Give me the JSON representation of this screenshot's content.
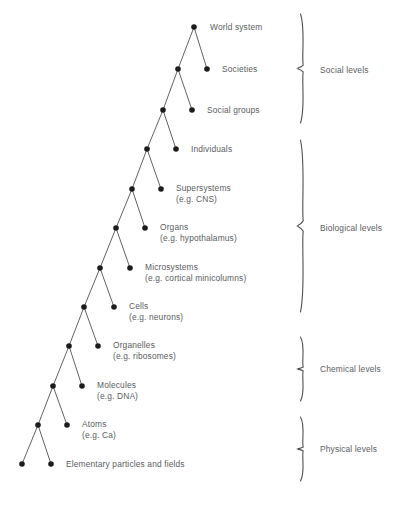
{
  "figure": {
    "type": "hierarchy-tree-diagram",
    "background_color": "#ffffff",
    "line_color": "#4d5053",
    "node_color": "#1c1c1c",
    "text_color": "#5a5d60"
  },
  "tree": {
    "description": "Binary branching hierarchy descending from World system at the apex to Elementary particles and fields at the base.",
    "nodes": [
      {
        "id": "world-system",
        "x": 194,
        "y": 27,
        "label": "World system",
        "sublabel": "",
        "label_x": 210,
        "label_y": 22,
        "labeled": true
      },
      {
        "id": "societies",
        "x": 207,
        "y": 69,
        "label": "Societies",
        "sublabel": "",
        "label_x": 222,
        "label_y": 64,
        "labeled": true
      },
      {
        "id": "societies-parent",
        "x": 178,
        "y": 69,
        "label": "",
        "sublabel": "",
        "label_x": 0,
        "label_y": 0,
        "labeled": false
      },
      {
        "id": "social-groups",
        "x": 192,
        "y": 110,
        "label": "Social groups",
        "sublabel": "",
        "label_x": 207,
        "label_y": 105,
        "labeled": true
      },
      {
        "id": "social-groups-parent",
        "x": 163,
        "y": 110,
        "label": "",
        "sublabel": "",
        "label_x": 0,
        "label_y": 0,
        "labeled": false
      },
      {
        "id": "individuals",
        "x": 176,
        "y": 149,
        "label": "Individuals",
        "sublabel": "",
        "label_x": 191,
        "label_y": 144,
        "labeled": true
      },
      {
        "id": "individuals-parent",
        "x": 147,
        "y": 149,
        "label": "",
        "sublabel": "",
        "label_x": 0,
        "label_y": 0,
        "labeled": false
      },
      {
        "id": "supersystems",
        "x": 161,
        "y": 189,
        "label": "Supersystems",
        "sublabel": "(e.g. CNS)",
        "label_x": 176,
        "label_y": 183,
        "labeled": true
      },
      {
        "id": "supersystems-parent",
        "x": 132,
        "y": 189,
        "label": "",
        "sublabel": "",
        "label_x": 0,
        "label_y": 0,
        "labeled": false
      },
      {
        "id": "organs",
        "x": 145,
        "y": 228,
        "label": "Organs",
        "sublabel": "(e.g. hypothalamus)",
        "label_x": 160,
        "label_y": 222,
        "labeled": true
      },
      {
        "id": "organs-parent",
        "x": 116,
        "y": 228,
        "label": "",
        "sublabel": "",
        "label_x": 0,
        "label_y": 0,
        "labeled": false
      },
      {
        "id": "microsystems",
        "x": 130,
        "y": 268,
        "label": "Microsystems",
        "sublabel": "(e.g. cortical minicolumns)",
        "label_x": 145,
        "label_y": 262,
        "labeled": true
      },
      {
        "id": "microsystems-parent",
        "x": 100,
        "y": 268,
        "label": "",
        "sublabel": "",
        "label_x": 0,
        "label_y": 0,
        "labeled": false
      },
      {
        "id": "cells",
        "x": 114,
        "y": 307,
        "label": "Cells",
        "sublabel": "(e.g. neurons)",
        "label_x": 129,
        "label_y": 301,
        "labeled": true
      },
      {
        "id": "cells-parent",
        "x": 84,
        "y": 307,
        "label": "",
        "sublabel": "",
        "label_x": 0,
        "label_y": 0,
        "labeled": false
      },
      {
        "id": "organelles",
        "x": 98,
        "y": 346,
        "label": "Organelles",
        "sublabel": "(e.g. ribosomes)",
        "label_x": 113,
        "label_y": 340,
        "labeled": true
      },
      {
        "id": "organelles-parent",
        "x": 69,
        "y": 346,
        "label": "",
        "sublabel": "",
        "label_x": 0,
        "label_y": 0,
        "labeled": false
      },
      {
        "id": "molecules",
        "x": 82,
        "y": 386,
        "label": "Molecules",
        "sublabel": "(e.g. DNA)",
        "label_x": 97,
        "label_y": 380,
        "labeled": true
      },
      {
        "id": "molecules-parent",
        "x": 53,
        "y": 386,
        "label": "",
        "sublabel": "",
        "label_x": 0,
        "label_y": 0,
        "labeled": false
      },
      {
        "id": "atoms",
        "x": 67,
        "y": 425,
        "label": "Atoms",
        "sublabel": "(e.g. Ca)",
        "label_x": 82,
        "label_y": 419,
        "labeled": true
      },
      {
        "id": "atoms-parent",
        "x": 38,
        "y": 425,
        "label": "",
        "sublabel": "",
        "label_x": 0,
        "label_y": 0,
        "labeled": false
      },
      {
        "id": "elementary-right",
        "x": 51,
        "y": 464,
        "label": "Elementary particles and fields",
        "sublabel": "",
        "label_x": 66,
        "label_y": 459,
        "labeled": true
      },
      {
        "id": "elementary-left",
        "x": 22,
        "y": 464,
        "label": "",
        "sublabel": "",
        "label_x": 0,
        "label_y": 0,
        "labeled": false
      }
    ],
    "edges": [
      {
        "from": "world-system",
        "to": "societies-parent"
      },
      {
        "from": "world-system",
        "to": "societies"
      },
      {
        "from": "societies-parent",
        "to": "social-groups-parent"
      },
      {
        "from": "societies-parent",
        "to": "social-groups"
      },
      {
        "from": "social-groups-parent",
        "to": "individuals-parent"
      },
      {
        "from": "social-groups-parent",
        "to": "individuals"
      },
      {
        "from": "individuals-parent",
        "to": "supersystems-parent"
      },
      {
        "from": "individuals-parent",
        "to": "supersystems"
      },
      {
        "from": "supersystems-parent",
        "to": "organs-parent"
      },
      {
        "from": "supersystems-parent",
        "to": "organs"
      },
      {
        "from": "organs-parent",
        "to": "microsystems-parent"
      },
      {
        "from": "organs-parent",
        "to": "microsystems"
      },
      {
        "from": "microsystems-parent",
        "to": "cells-parent"
      },
      {
        "from": "microsystems-parent",
        "to": "cells"
      },
      {
        "from": "cells-parent",
        "to": "organelles-parent"
      },
      {
        "from": "cells-parent",
        "to": "organelles"
      },
      {
        "from": "organelles-parent",
        "to": "molecules-parent"
      },
      {
        "from": "organelles-parent",
        "to": "molecules"
      },
      {
        "from": "molecules-parent",
        "to": "atoms-parent"
      },
      {
        "from": "molecules-parent",
        "to": "atoms"
      },
      {
        "from": "atoms-parent",
        "to": "elementary-left"
      },
      {
        "from": "atoms-parent",
        "to": "elementary-right"
      }
    ]
  },
  "groups": [
    {
      "id": "social-levels",
      "label": "Social levels",
      "brace_top": 14,
      "brace_bottom": 123,
      "brace_x": 302,
      "label_x": 320,
      "label_y": 65
    },
    {
      "id": "biological-levels",
      "label": "Biological levels",
      "brace_top": 140,
      "brace_bottom": 312,
      "brace_x": 302,
      "label_x": 320,
      "label_y": 223
    },
    {
      "id": "chemical-levels",
      "label": "Chemical levels",
      "brace_top": 337,
      "brace_bottom": 401,
      "brace_x": 302,
      "label_x": 320,
      "label_y": 364
    },
    {
      "id": "physical-levels",
      "label": "Physical levels",
      "brace_top": 417,
      "brace_bottom": 481,
      "brace_x": 302,
      "label_x": 320,
      "label_y": 444
    }
  ]
}
